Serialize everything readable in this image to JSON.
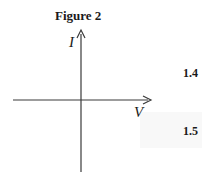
{
  "figure": {
    "title": "Figure 2",
    "y_axis_label": "I",
    "x_axis_label": "V"
  },
  "side_numbers": [
    "1.4",
    "1.5"
  ],
  "colors": {
    "axis": "#3a3a3a",
    "text": "#1a1a1a"
  }
}
